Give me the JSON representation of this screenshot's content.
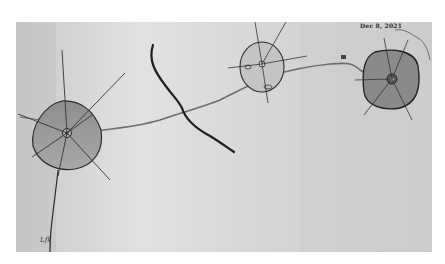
{
  "photo": {
    "subject": "hand-drawn pencil sketch of three cell-like shapes connected by a wavy line",
    "paper_color": "#dcdcdc",
    "ink_color": "#2b2b2b",
    "fill_color": "#9c9c9c"
  },
  "annotations": {
    "date": "Dec 8, 2021",
    "bottom_left_scribble": "Lfk"
  },
  "drawing": {
    "cells": [
      {
        "name": "large-left-cell",
        "cx": 66,
        "cy": 136,
        "rx": 35,
        "ry": 32
      },
      {
        "name": "middle-cell",
        "cx": 262,
        "cy": 67,
        "rx": 22,
        "ry": 25
      },
      {
        "name": "right-cell",
        "cx": 392,
        "cy": 79,
        "rx": 29,
        "ry": 27
      }
    ],
    "connecting_line": "wavy thread linking the three cells",
    "branch": "dark forked river-like stroke in the center"
  }
}
